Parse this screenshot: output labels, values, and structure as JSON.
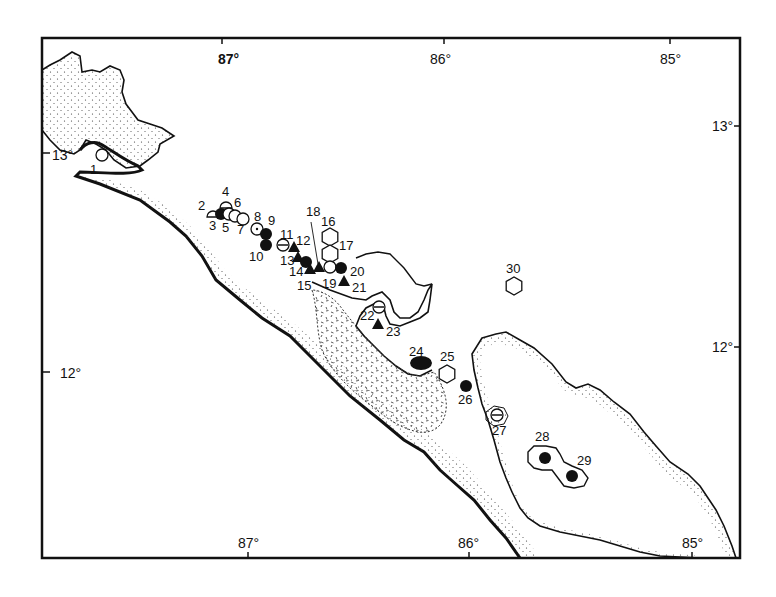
{
  "map": {
    "frame": {
      "x": 42,
      "y": 38,
      "w": 698,
      "h": 520,
      "stroke": "#111111"
    },
    "axis_labels": {
      "top": [
        {
          "text": "87°",
          "x": 218,
          "y": 64,
          "tick_x": 222,
          "bold": true
        },
        {
          "text": "86°",
          "x": 430,
          "y": 64,
          "tick_x": 444,
          "bold": false
        },
        {
          "text": "85°",
          "x": 660,
          "y": 64,
          "tick_x": 670,
          "bold": false
        }
      ],
      "bottom": [
        {
          "text": "87°",
          "x": 238,
          "y": 548,
          "tick_x": 248
        },
        {
          "text": "86°",
          "x": 458,
          "y": 548,
          "tick_x": 469
        },
        {
          "text": "85°",
          "x": 682,
          "y": 548,
          "tick_x": 692
        }
      ],
      "left": [
        {
          "text": "13°",
          "x": 52,
          "y": 160,
          "tick_y": 153
        },
        {
          "text": "12°",
          "x": 60,
          "y": 378,
          "tick_y": 372
        }
      ],
      "right": [
        {
          "text": "13°",
          "x": 712,
          "y": 131,
          "tick_y": 126
        },
        {
          "text": "12°",
          "x": 712,
          "y": 352,
          "tick_y": 347
        }
      ]
    },
    "symbols": {
      "open-circle": "○",
      "filled-circle": "●",
      "filled-triangle": "▲",
      "open-half-circle": "◠",
      "hexagon": "⬡",
      "theta-circle": "⊖",
      "filled-ellipse": "⬬",
      "dot-circle": "⊙"
    },
    "sites": [
      {
        "id": "1",
        "symbol": "open-circle",
        "x": 102,
        "y": 155,
        "lx": 90,
        "ly": 174
      },
      {
        "id": "2",
        "symbol": "open-half-circle",
        "x": 213,
        "y": 214,
        "lx": 198,
        "ly": 210
      },
      {
        "id": "3",
        "symbol": "filled-circle",
        "x": 221,
        "y": 214,
        "lx": 209,
        "ly": 230
      },
      {
        "id": "4",
        "symbol": "open-half-circle",
        "x": 226,
        "y": 205,
        "lx": 222,
        "ly": 196
      },
      {
        "id": "5",
        "symbol": "open-circle",
        "x": 229,
        "y": 214,
        "lx": 222,
        "ly": 232
      },
      {
        "id": "6",
        "symbol": "open-circle",
        "x": 235,
        "y": 216,
        "lx": 234,
        "ly": 207
      },
      {
        "id": "7",
        "symbol": "open-circle",
        "x": 243,
        "y": 219,
        "lx": 237,
        "ly": 234
      },
      {
        "id": "8",
        "symbol": "dot-circle",
        "x": 257,
        "y": 229,
        "lx": 254,
        "ly": 221
      },
      {
        "id": "9",
        "symbol": "filled-circle",
        "x": 266,
        "y": 234,
        "lx": 268,
        "ly": 225
      },
      {
        "id": "10",
        "symbol": "filled-circle",
        "x": 266,
        "y": 245,
        "lx": 249,
        "ly": 261
      },
      {
        "id": "11",
        "symbol": "theta-circle",
        "x": 283,
        "y": 245,
        "lx": 280,
        "ly": 239
      },
      {
        "id": "12",
        "symbol": "filled-triangle",
        "x": 294,
        "y": 248,
        "lx": 296,
        "ly": 245
      },
      {
        "id": "13",
        "symbol": "filled-triangle",
        "x": 298,
        "y": 258,
        "lx": 280,
        "ly": 265
      },
      {
        "id": "14",
        "symbol": "filled-circle",
        "x": 306,
        "y": 262,
        "lx": 289,
        "ly": 276
      },
      {
        "id": "15",
        "symbol": "filled-triangle",
        "x": 310,
        "y": 270,
        "lx": 297,
        "ly": 290
      },
      {
        "id": "16",
        "symbol": "hexagon",
        "x": 330,
        "y": 237,
        "lx": 321,
        "ly": 226
      },
      {
        "id": "17",
        "symbol": "hexagon",
        "x": 330,
        "y": 254,
        "lx": 339,
        "ly": 250
      },
      {
        "id": "18",
        "symbol": "filled-triangle",
        "x": 319,
        "y": 268,
        "lx": 306,
        "ly": 216
      },
      {
        "id": "19",
        "symbol": "open-circle",
        "x": 330,
        "y": 267,
        "lx": 322,
        "ly": 288
      },
      {
        "id": "20",
        "symbol": "filled-circle",
        "x": 341,
        "y": 268,
        "lx": 350,
        "ly": 276
      },
      {
        "id": "21",
        "symbol": "filled-triangle",
        "x": 344,
        "y": 282,
        "lx": 352,
        "ly": 292
      },
      {
        "id": "22",
        "symbol": "theta-circle",
        "x": 379,
        "y": 307,
        "lx": 360,
        "ly": 320
      },
      {
        "id": "23",
        "symbol": "filled-triangle",
        "x": 378,
        "y": 325,
        "lx": 386,
        "ly": 336
      },
      {
        "id": "24",
        "symbol": "filled-ellipse",
        "x": 421,
        "y": 363,
        "lx": 409,
        "ly": 356
      },
      {
        "id": "25",
        "symbol": "hexagon",
        "x": 447,
        "y": 374,
        "lx": 440,
        "ly": 361
      },
      {
        "id": "26",
        "symbol": "filled-circle",
        "x": 466,
        "y": 386,
        "lx": 458,
        "ly": 404
      },
      {
        "id": "27",
        "symbol": "theta-circle",
        "x": 497,
        "y": 415,
        "lx": 492,
        "ly": 435
      },
      {
        "id": "28",
        "symbol": "filled-circle",
        "x": 545,
        "y": 458,
        "lx": 535,
        "ly": 441
      },
      {
        "id": "29",
        "symbol": "filled-circle",
        "x": 572,
        "y": 476,
        "lx": 577,
        "ly": 465
      },
      {
        "id": "30",
        "symbol": "hexagon",
        "x": 514,
        "y": 286,
        "lx": 506,
        "ly": 273
      }
    ],
    "colors": {
      "ink": "#111111",
      "paper": "#ffffff",
      "stipple": "#333333"
    }
  }
}
